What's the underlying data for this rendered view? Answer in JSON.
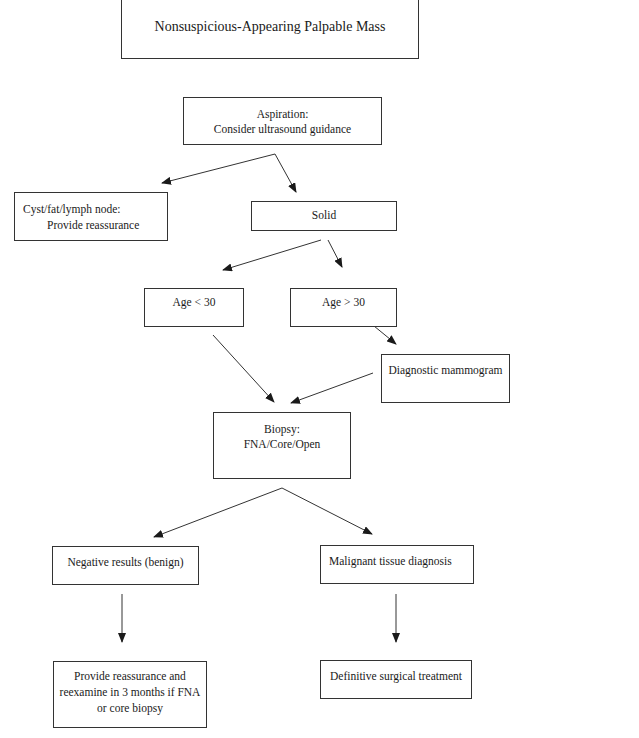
{
  "diagram": {
    "type": "flowchart",
    "nodes": {
      "start": {
        "label": "Nonsuspicious-Appearing Palpable Mass"
      },
      "aspiration": {
        "line1": "Aspiration:",
        "line2": "Consider ultrasound guidance"
      },
      "cyst": {
        "line1": "Cyst/fat/lymph node:",
        "line2": "Provide reassurance"
      },
      "solid": {
        "label": "Solid"
      },
      "age_under_30": {
        "label": "Age < 30"
      },
      "age_over_30": {
        "label": "Age > 30"
      },
      "mammogram": {
        "label": "Diagnostic mammogram"
      },
      "biopsy": {
        "line1": "Biopsy:",
        "line2": "FNA/Core/Open"
      },
      "negative": {
        "label": "Negative results (benign)"
      },
      "malignant": {
        "label": "Malignant tissue diagnosis"
      },
      "reassure": {
        "line1": "Provide reassurance and",
        "line2": "reexamine in 3 months if FNA",
        "line3": "or core biopsy"
      },
      "surgery": {
        "label": "Definitive surgical treatment"
      }
    },
    "edges": [
      {
        "from": "aspiration",
        "to": "cyst"
      },
      {
        "from": "aspiration",
        "to": "solid"
      },
      {
        "from": "solid",
        "to": "age_under_30"
      },
      {
        "from": "solid",
        "to": "age_over_30"
      },
      {
        "from": "age_over_30",
        "to": "mammogram"
      },
      {
        "from": "age_under_30",
        "to": "biopsy"
      },
      {
        "from": "mammogram",
        "to": "biopsy"
      },
      {
        "from": "biopsy",
        "to": "negative"
      },
      {
        "from": "biopsy",
        "to": "malignant"
      },
      {
        "from": "negative",
        "to": "reassure"
      },
      {
        "from": "malignant",
        "to": "surgery"
      }
    ],
    "colors": {
      "line": "#333333",
      "background": "#ffffff"
    }
  }
}
